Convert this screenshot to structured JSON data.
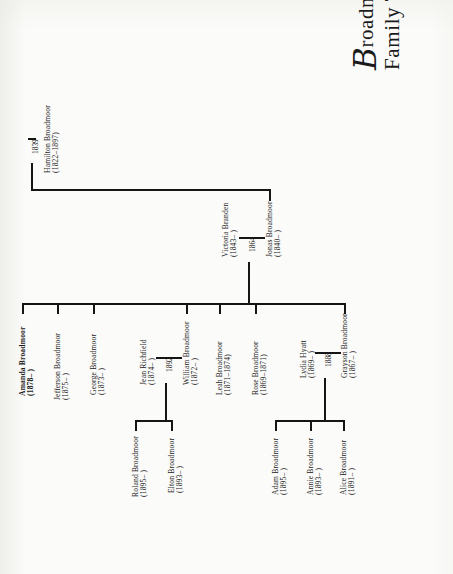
{
  "document": {
    "title_ornate_initial": "B",
    "title_line1": "roadmoor",
    "title_line2": "Family Tree",
    "page_background": "#fbfbf9",
    "ink_color": "#151515",
    "orientation": "text rotated 90 degrees counter-clockwise"
  },
  "generations": {
    "g0": {
      "label": "root ancestor",
      "person": {
        "name": "Hamilton Broadmoor",
        "dates": "(1822–1897)"
      },
      "marriage_year": "1839"
    },
    "g1": {
      "label": "second generation couple",
      "husband": {
        "name": "Jonas Broadmoor",
        "dates": "(1840–   )"
      },
      "wife": {
        "name": "Victoria Branden",
        "dates": "(1843–   )"
      },
      "marriage_year": "1864"
    },
    "g2": {
      "label": "children of Jonas and Victoria",
      "children": [
        {
          "name": "Grayson Broadmoor",
          "dates": "(1867–   )",
          "bold": false
        },
        {
          "name": "Rose Broadmoor",
          "dates": "(1869–1871)",
          "bold": false
        },
        {
          "name": "Leah Broadmoor",
          "dates": "(1871–1874)",
          "bold": false
        },
        {
          "name": "William Broadmoor",
          "dates": "(1872–   )",
          "bold": false
        },
        {
          "name": "George Broadmoor",
          "dates": "(1873–   )",
          "bold": false
        },
        {
          "name": "Jefferson Broadmoor",
          "dates": "(1875–   )",
          "bold": false
        },
        {
          "name": "Amanda Broadmoor",
          "dates": "(1878–   )",
          "bold": true
        }
      ],
      "spouses": [
        {
          "of": "Grayson Broadmoor",
          "name": "Lydia Hyatt",
          "dates": "(1869–   )",
          "marriage_year": "1888"
        },
        {
          "of": "William Broadmoor",
          "name": "Jean Richfield",
          "dates": "(1874–   )",
          "marriage_year": "1892"
        }
      ]
    },
    "g3": {
      "label": "third generation",
      "grayson_children": [
        {
          "name": "Alice Broadmoor",
          "dates": "(1891–   )"
        },
        {
          "name": "Annie Broadmoor",
          "dates": "(1893–   )"
        },
        {
          "name": "Adam Broadmoor",
          "dates": "(1895–   )"
        }
      ],
      "william_children": [
        {
          "name": "Elton Broadmoor",
          "dates": "(1893–   )"
        },
        {
          "name": "Roland Broadmoor",
          "dates": "(1895–   )"
        }
      ]
    }
  }
}
